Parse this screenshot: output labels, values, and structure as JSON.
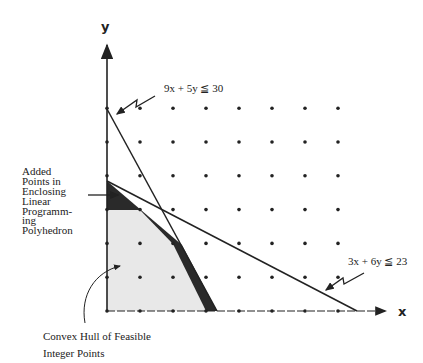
{
  "diagram": {
    "axes": {
      "x_label": "x",
      "y_label": "y"
    },
    "constraints": [
      {
        "id": "c1",
        "label": "9x + 5y ≦ 30",
        "a": 9,
        "b": 5,
        "rhs": 30
      },
      {
        "id": "c2",
        "label": "3x + 6y ≦ 23",
        "a": 3,
        "b": 6,
        "rhs": 23
      }
    ],
    "annotations": {
      "added_points": [
        "Added",
        "Points in",
        "Enclosing",
        "Linear",
        "Programm-",
        "ing",
        "Polyhedron"
      ],
      "convex_hull": [
        "Convex Hull of Feasible",
        "Integer Points"
      ]
    },
    "grid": {
      "x_max": 7,
      "y_max": 6
    },
    "convex_hull_vertices": [
      [
        0,
        0
      ],
      [
        3,
        0
      ],
      [
        2,
        2
      ],
      [
        1,
        3
      ],
      [
        0,
        3
      ]
    ],
    "lp_vertices": [
      [
        0,
        0
      ],
      [
        3.333,
        0
      ],
      [
        2.246,
        1.957
      ],
      [
        0,
        3.833
      ]
    ],
    "colors": {
      "ink": "#222222",
      "dark_band": "#2a2a2a",
      "hull_fill": "#e6e6e6"
    }
  }
}
